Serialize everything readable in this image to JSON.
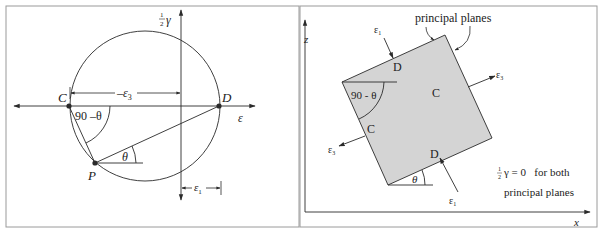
{
  "mohr_circle": {
    "point_c": "C",
    "point_d": "D",
    "point_p": "P",
    "angle_at_c": "90 –θ",
    "angle_at_p": "θ",
    "x_axis_label": "ε",
    "y_axis_label_fraction_num": "1",
    "y_axis_label_fraction_den": "2",
    "y_axis_label_symbol": "γ",
    "dim_neg_eps3_label": "–ε",
    "dim_neg_eps3_sub": "3",
    "dim_eps1_label": "ε",
    "dim_eps1_sub": "1"
  },
  "element": {
    "z_axis_label": "z",
    "x_axis_label": "x",
    "principal_planes_label": "principal planes",
    "face_top": "D",
    "face_bottom": "D",
    "face_left": "C",
    "face_right": "C",
    "angle_corner": "90 - θ",
    "angle_bottom": "θ",
    "eps1_top": "ε",
    "eps1_top_sub": "1",
    "eps1_bottom": "ε",
    "eps1_bottom_sub": "1",
    "eps3_right": "ε",
    "eps3_right_sub": "3",
    "eps3_left": "ε",
    "eps3_left_sub": "3",
    "note_fraction_num": "1",
    "note_fraction_den": "2",
    "note_line1": "γ = 0   for both",
    "note_line2": "principal planes"
  },
  "colors": {
    "line": "#2a2a2a",
    "fill": "#d4d4d4",
    "frame": "#9a9a9a"
  }
}
